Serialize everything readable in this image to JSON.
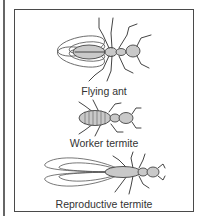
{
  "diagram": {
    "type": "illustration",
    "items": [
      {
        "label": "Flying ant",
        "icon": "flying-ant-icon"
      },
      {
        "label": "Worker termite",
        "icon": "worker-termite-icon"
      },
      {
        "label": "Reproductive termite",
        "icon": "reproductive-termite-icon"
      }
    ],
    "colors": {
      "border": "#4a4a4a",
      "body_fill": "#c9c9c9",
      "line": "#444444",
      "text": "#333333"
    }
  }
}
